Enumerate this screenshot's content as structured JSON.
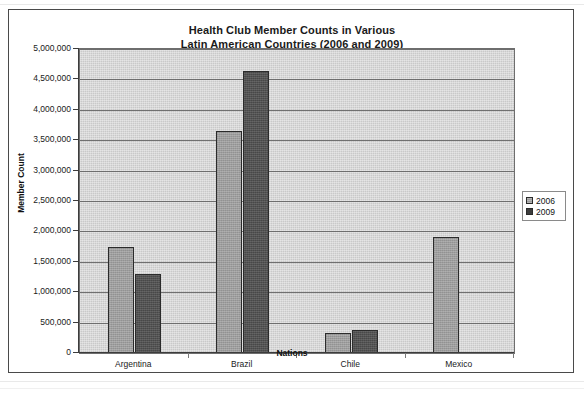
{
  "chart_data": {
    "type": "bar",
    "title": "Health Club Member Counts in Various Latin American Countries (2006 and 2009)",
    "title_lines": [
      "Health Club Member Counts in Various",
      "Latin American Countries (2006 and 2009)"
    ],
    "xlabel": "Nations",
    "ylabel": "Member Count",
    "categories": [
      "Argentina",
      "Brazil",
      "Chile",
      "Mexico"
    ],
    "series": [
      {
        "name": "2006",
        "color": "#9d9d9d",
        "values": [
          1740000,
          3650000,
          330000,
          1900000
        ]
      },
      {
        "name": "2009",
        "color": "#484848",
        "values": [
          1300000,
          4640000,
          380000,
          null
        ]
      }
    ],
    "ylim": [
      0,
      5000000
    ],
    "ytick_step": 500000,
    "ytick_labels": [
      "5,000,000",
      "4,500,000",
      "4,000,000",
      "3,500,000",
      "3,000,000",
      "2,500,000",
      "2,000,000",
      "1,500,000",
      "1,000,000",
      "500,000",
      "0"
    ],
    "ytick_values": [
      5000000,
      4500000,
      4000000,
      3500000,
      3000000,
      2500000,
      2000000,
      1500000,
      1000000,
      500000,
      0
    ],
    "grid": true,
    "grid_axis": "y",
    "legend_position": "right",
    "plot_background": "#c9c9c9",
    "figure_background": "#ffffff"
  },
  "legend": {
    "entries": [
      {
        "label": "2006"
      },
      {
        "label": "2009"
      }
    ]
  }
}
